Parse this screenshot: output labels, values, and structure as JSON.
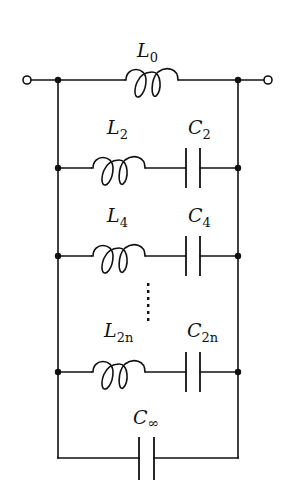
{
  "diagram": {
    "type": "circuit-schematic",
    "terminals": [
      "input-terminal",
      "output-terminal"
    ],
    "series_element": {
      "label_main": "L",
      "label_sub": "0",
      "kind": "inductor"
    },
    "branches": [
      {
        "inductor": {
          "label_main": "L",
          "label_sub": "2"
        },
        "capacitor": {
          "label_main": "C",
          "label_sub": "2"
        }
      },
      {
        "inductor": {
          "label_main": "L",
          "label_sub": "4"
        },
        "capacitor": {
          "label_main": "C",
          "label_sub": "4"
        }
      },
      {
        "inductor": {
          "label_main": "L",
          "label_sub": "2n"
        },
        "capacitor": {
          "label_main": "C",
          "label_sub": "2n"
        }
      }
    ],
    "ellipsis": "vertical-dots",
    "final_capacitor": {
      "label_main": "C",
      "label_sub": "∞"
    },
    "colors": {
      "stroke": "#111111",
      "background": "#ffffff"
    }
  }
}
